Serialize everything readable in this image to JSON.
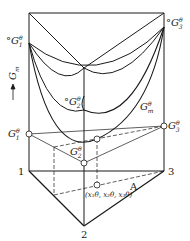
{
  "figure": {
    "type": "ternary Gibbs free energy prism diagram",
    "axis_label": "G_m",
    "axis_arrow": "up-arrow",
    "stroke_color": "#1a1a1a",
    "background": "#ffffff"
  },
  "labels": {
    "pure_G1_top": {
      "prefix": "°",
      "base": "G",
      "sub": "1",
      "sup": "θ"
    },
    "pure_G2_top": {
      "prefix": "°",
      "base": "G",
      "sub": "2",
      "sup": "θ"
    },
    "pure_G3_top": {
      "prefix": "°",
      "base": "G",
      "sub": "3",
      "sup": "θ"
    },
    "mixture_surface": {
      "base": "G",
      "sub": "m",
      "sup": "θ"
    },
    "partial_G1": {
      "base": "G",
      "sub": "1",
      "sup": "θ"
    },
    "partial_G2": {
      "base": "G",
      "sub": "2",
      "sup": "θ"
    },
    "partial_G3": {
      "base": "G",
      "sub": "3",
      "sup": "θ"
    },
    "vertex_1": "1",
    "vertex_2": "2",
    "vertex_3": "3",
    "composition_point": "(x₁θ, x₂θ, x₃θ)",
    "point_A": "A",
    "y_axis": "G",
    "y_axis_sub": "m"
  }
}
